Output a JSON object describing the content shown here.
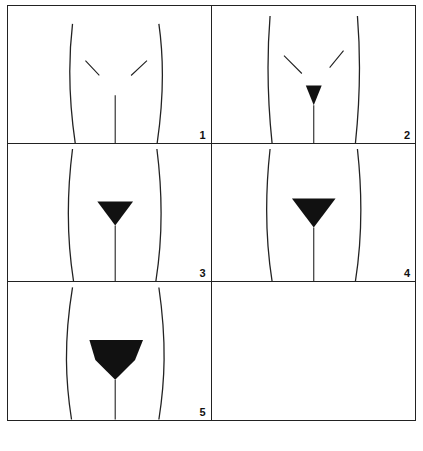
{
  "figure": {
    "title": "",
    "stages": [
      {
        "label": "1",
        "shade_scale": 0.0
      },
      {
        "label": "2",
        "shade_scale": 0.35
      },
      {
        "label": "3",
        "shade_scale": 0.55
      },
      {
        "label": "4",
        "shade_scale": 0.75
      },
      {
        "label": "5",
        "shade_scale": 1.0
      }
    ],
    "empty_cell": true,
    "caption": ""
  },
  "colors": {
    "line": "#222222",
    "shade": "#111111",
    "background": "#ffffff"
  }
}
